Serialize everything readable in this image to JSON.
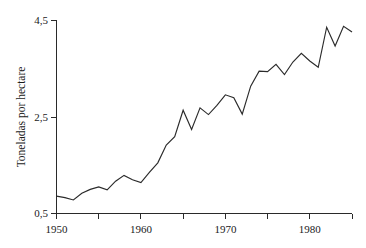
{
  "chart_data": {
    "type": "line",
    "title": "",
    "subtitle": "",
    "xlabel": "",
    "ylabel": "Toneladas por hectare",
    "xlim": [
      1950,
      1985
    ],
    "ylim": [
      0.5,
      4.5
    ],
    "grid": false,
    "legend": null,
    "decimal_separator": ",",
    "y_ticks": [
      {
        "value": 0.5,
        "label": "0,5"
      },
      {
        "value": 2.5,
        "label": "2,5"
      },
      {
        "value": 4.5,
        "label": "4,5"
      }
    ],
    "x_ticks_major": [
      {
        "value": 1950,
        "label": "1950"
      },
      {
        "value": 1960,
        "label": "1960"
      },
      {
        "value": 1970,
        "label": "1970"
      },
      {
        "value": 1980,
        "label": "1980"
      }
    ],
    "x_ticks_minor": [
      1955,
      1965,
      1975,
      1985
    ],
    "x": [
      1950,
      1951,
      1952,
      1953,
      1954,
      1955,
      1956,
      1957,
      1958,
      1959,
      1960,
      1961,
      1962,
      1963,
      1964,
      1965,
      1966,
      1967,
      1968,
      1969,
      1970,
      1971,
      1972,
      1973,
      1974,
      1975,
      1976,
      1977,
      1978,
      1979,
      1980,
      1981,
      1982,
      1983,
      1984,
      1985
    ],
    "series": [
      {
        "name": "Toneladas por hectare",
        "color": "#2b2b2b",
        "values": [
          0.86,
          0.83,
          0.78,
          0.92,
          1.0,
          1.05,
          0.99,
          1.17,
          1.29,
          1.2,
          1.14,
          1.35,
          1.55,
          1.92,
          2.09,
          2.64,
          2.24,
          2.69,
          2.55,
          2.74,
          2.96,
          2.9,
          2.56,
          3.14,
          3.45,
          3.44,
          3.59,
          3.38,
          3.64,
          3.82,
          3.66,
          3.53,
          4.36,
          3.97,
          4.38,
          4.26
        ]
      }
    ]
  },
  "axis": {
    "y_tick_top_label": "4,5",
    "y_tick_mid_label": "2,5",
    "y_tick_bottom_label": "0,5",
    "x_tick_1_label": "1950",
    "x_tick_2_label": "1960",
    "x_tick_3_label": "1970",
    "x_tick_4_label": "1980",
    "y_axis_title": "Toneladas por hectare"
  }
}
